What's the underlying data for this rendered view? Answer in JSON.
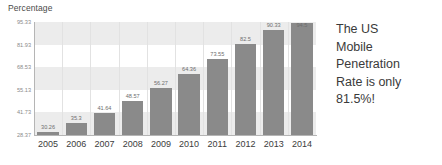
{
  "chart_data": {
    "type": "bar",
    "title": "Percentage",
    "xlabel": "",
    "ylabel": "",
    "categories": [
      "2005",
      "2006",
      "2007",
      "2008",
      "2009",
      "2010",
      "2011",
      "2012",
      "2013",
      "2014"
    ],
    "values": [
      30.26,
      35.3,
      41.64,
      48.57,
      56.27,
      64.36,
      73.55,
      82.5,
      90.33,
      94.5
    ],
    "value_labels": [
      "30.26",
      "35.3",
      "41.64",
      "48.57",
      "56.27",
      "64.36",
      "73.55",
      "82.5",
      "90.33",
      "94.5"
    ],
    "ytick_labels": [
      "95.33",
      "81.93",
      "68.53",
      "55.13",
      "41.73",
      "28.37"
    ],
    "ytick_values": [
      95.33,
      81.93,
      68.53,
      55.13,
      41.73,
      28.37
    ],
    "ylim": [
      28.37,
      95.33
    ],
    "grid": "vertical-gridlines-and-horizontal-bands",
    "legend": "none",
    "bar_color": "#8a8a8a",
    "band_color": "#ececec",
    "gridline_color": "#e2e2e2"
  },
  "callout": {
    "lines": [
      "The US",
      "Mobile",
      "Penetration",
      "Rate is only",
      "81.5%!"
    ],
    "text": "The US Mobile Penetration Rate is only 81.5%!"
  }
}
